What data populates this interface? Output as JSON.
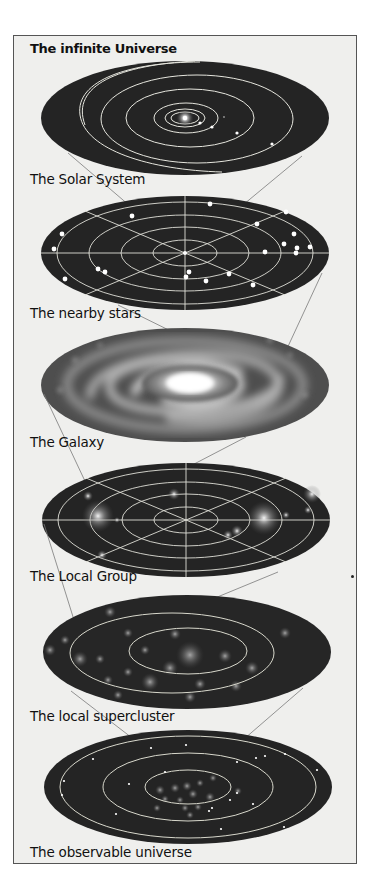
{
  "figure": {
    "title": "The infinite Universe",
    "panels": [
      {
        "id": "solar-system",
        "label": "The  Solar  System"
      },
      {
        "id": "nearby-stars",
        "label": "The nearby stars"
      },
      {
        "id": "galaxy",
        "label": "The Galaxy"
      },
      {
        "id": "local-group",
        "label": "The Local Group"
      },
      {
        "id": "local-supercluster",
        "label": "The local supercluster"
      },
      {
        "id": "observable-universe",
        "label": "The observable universe"
      }
    ]
  },
  "colors": {
    "background": "#efefed",
    "frame": "#555555",
    "disc": "#222222",
    "orbit": "#e8e8e0",
    "connector": "#777777",
    "text": "#111111"
  }
}
